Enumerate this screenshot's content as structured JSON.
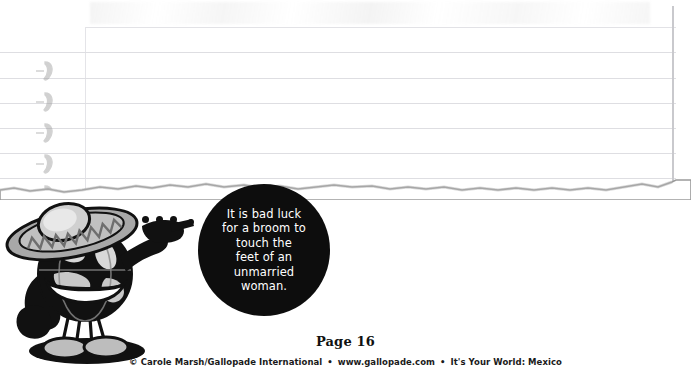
{
  "page": {
    "width": 691,
    "height": 380,
    "background_color": "#ffffff"
  },
  "notebook": {
    "name": "ruled-notebook-paper",
    "line_color": "#dedee2",
    "margin_line_color": "#e4e4e8",
    "rule_tops": [
      27,
      52,
      78,
      103,
      128,
      153,
      178
    ],
    "binding_marks": 5,
    "binding_tops": [
      58,
      89,
      120,
      151,
      182
    ],
    "torn_edge_top": 178
  },
  "fact_bubble": {
    "background_color": "#0d0d0d",
    "text_color": "#ffffff",
    "lines": [
      "It is bad luck",
      "for a broom to",
      "touch the",
      "feet of an",
      "unmarried",
      "woman."
    ],
    "full_text": "It is bad luck for a broom to touch the feet of an unmarried woman."
  },
  "pointer_trail": {
    "dot_count": 5,
    "dot_color": "#111111",
    "dots": [
      {
        "x": 128,
        "y": 216
      },
      {
        "x": 142,
        "y": 216
      },
      {
        "x": 156,
        "y": 216
      },
      {
        "x": 170,
        "y": 216
      },
      {
        "x": 188,
        "y": 219
      }
    ]
  },
  "mascot": {
    "name": "globe-character-with-sombrero",
    "description": "Cartoon globe wearing a sombrero, pointing to the right",
    "hat_color": "#a8a8a8",
    "body_color": "#1a1a1a",
    "highlight_color": "#d5d5d5"
  },
  "footer": {
    "page_label": "Page 16",
    "copyright_symbol": "©",
    "publisher": "Carole Marsh/Gallopade International",
    "website": "www.gallopade.com",
    "title": "It's Your World:  Mexico",
    "separator": "•"
  }
}
